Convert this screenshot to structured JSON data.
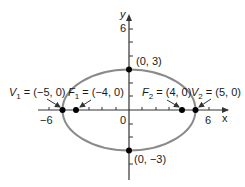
{
  "diagram": {
    "type": "ellipse",
    "colors": {
      "ellipse": "#8a8a8a",
      "axis": "#333333",
      "point": "#000000",
      "text": "#1a1a1a"
    },
    "axes": {
      "x_label": "x",
      "y_label": "y",
      "x_ticks": {
        "neg": "−6",
        "origin": "0",
        "pos": "6"
      },
      "y_ticks": {
        "top": "6"
      }
    },
    "points": {
      "top": "(0, 3)",
      "bottom": "(0, −3)",
      "v1_name": "V",
      "v1_sub": "1",
      "v1_value": " = (−5,  0)",
      "f1_name": "F",
      "f1_sub": "1",
      "f1_value": " = (−4, 0)",
      "f2_name": "F",
      "f2_sub": "2",
      "f2_value": " = (4, 0)",
      "v2_name": "V",
      "v2_sub": "2",
      "v2_value": " = (5, 0)"
    }
  }
}
